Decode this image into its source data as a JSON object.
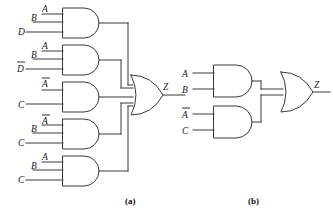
{
  "figure": {
    "panels": [
      {
        "id": "a",
        "caption": "(a)",
        "caption_x": 133,
        "caption_y": 202
      },
      {
        "id": "b",
        "caption": "(b)",
        "caption_y": 202,
        "caption_x": 255
      }
    ],
    "colors": {
      "stroke": "#3a3a3a",
      "text": "#1a1a1a",
      "background": "#ffffff"
    }
  },
  "panel_a": {
    "name": "five-and-gates-into-or-gate",
    "output_label": "Z",
    "output_label_x": 163,
    "output_label_y": 90,
    "gates": [
      {
        "name": "and-gate-1",
        "x": 63,
        "y": 8,
        "w": 42,
        "h": 30,
        "inputs": [
          {
            "label": "A",
            "bar": false,
            "x": 42,
            "y": 14,
            "lx": 42,
            "ly": 12
          },
          {
            "label": "B",
            "bar": false,
            "x": 33,
            "y": 22,
            "lx": 32,
            "ly": 21
          },
          {
            "label": "D",
            "bar": false,
            "x": 26,
            "y": 32,
            "lx": 24,
            "ly": 34
          }
        ]
      },
      {
        "name": "and-gate-2",
        "x": 63,
        "y": 45,
        "w": 42,
        "h": 30,
        "inputs": [
          {
            "label": "A",
            "bar": false,
            "x": 42,
            "y": 51,
            "lx": 42,
            "ly": 49
          },
          {
            "label": "B",
            "bar": false,
            "x": 33,
            "y": 59,
            "lx": 32,
            "ly": 58
          },
          {
            "label": "D",
            "bar": true,
            "x": 26,
            "y": 69,
            "lx": 24,
            "ly": 71
          }
        ]
      },
      {
        "name": "and-gate-3",
        "x": 63,
        "y": 82,
        "w": 42,
        "h": 30,
        "inputs": [
          {
            "label": "A",
            "bar": true,
            "x": 42,
            "y": 90,
            "lx": 42,
            "ly": 88
          },
          {
            "label": "C",
            "bar": false,
            "x": 26,
            "y": 104,
            "lx": 24,
            "ly": 107
          }
        ]
      },
      {
        "name": "and-gate-4",
        "x": 63,
        "y": 119,
        "w": 42,
        "h": 30,
        "inputs": [
          {
            "label": "A",
            "bar": true,
            "x": 42,
            "y": 125,
            "lx": 42,
            "ly": 124
          },
          {
            "label": "B",
            "bar": false,
            "x": 33,
            "y": 133,
            "lx": 32,
            "ly": 132
          },
          {
            "label": "C",
            "bar": false,
            "x": 26,
            "y": 143,
            "lx": 24,
            "ly": 145
          }
        ]
      },
      {
        "name": "and-gate-5",
        "x": 63,
        "y": 156,
        "w": 42,
        "h": 30,
        "inputs": [
          {
            "label": "A",
            "bar": false,
            "x": 42,
            "y": 162,
            "lx": 42,
            "ly": 160
          },
          {
            "label": "B",
            "bar": false,
            "x": 33,
            "y": 170,
            "lx": 32,
            "ly": 169
          },
          {
            "label": "C",
            "bar": false,
            "x": 26,
            "y": 180,
            "lx": 24,
            "ly": 182
          }
        ]
      }
    ],
    "or_gate": {
      "name": "or-gate-a",
      "x": 118,
      "y": 75,
      "w": 42,
      "h": 40
    }
  },
  "panel_b": {
    "name": "two-and-gates-into-or-gate",
    "output_label": "Z",
    "output_label_x": 314,
    "output_label_y": 90,
    "gates": [
      {
        "name": "and-gate-b1",
        "x": 214,
        "y": 65,
        "w": 40,
        "h": 32,
        "inputs": [
          {
            "label": "A",
            "bar": false,
            "x": 193,
            "y": 73,
            "lx": 190,
            "ly": 76
          },
          {
            "label": "B",
            "bar": false,
            "x": 193,
            "y": 89,
            "lx": 190,
            "ly": 92
          }
        ]
      },
      {
        "name": "and-gate-b2",
        "x": 214,
        "y": 106,
        "w": 40,
        "h": 32,
        "inputs": [
          {
            "label": "A",
            "bar": true,
            "x": 193,
            "y": 114,
            "lx": 190,
            "ly": 117
          },
          {
            "label": "C",
            "bar": false,
            "x": 193,
            "y": 130,
            "lx": 190,
            "ly": 133
          }
        ]
      }
    ],
    "or_gate": {
      "name": "or-gate-b",
      "x": 270,
      "y": 76,
      "w": 42,
      "h": 40
    }
  }
}
